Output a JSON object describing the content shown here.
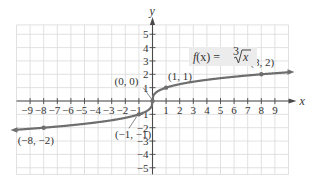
{
  "chart_data": {
    "type": "line",
    "title": "",
    "function_label": "f(x) = ∛x",
    "function_label_parts": {
      "lhs": "f(x) = ",
      "index": "3",
      "radical": "√",
      "radicand": "x"
    },
    "xlabel": "x",
    "ylabel": "y",
    "xlim": [
      -10,
      10
    ],
    "ylim": [
      -5.7,
      5.7
    ],
    "grid": true,
    "x_ticks": [
      -9,
      -8,
      -7,
      -6,
      -5,
      -4,
      -3,
      -2,
      -1,
      1,
      2,
      3,
      4,
      5,
      6,
      7,
      8,
      9
    ],
    "y_ticks": [
      -5,
      -4,
      -3,
      -2,
      -1,
      1,
      2,
      3,
      4,
      5
    ],
    "x_tick_labels": [
      "−9",
      "−8",
      "−7",
      "−6",
      "−5",
      "−4",
      "−3",
      "−2",
      "−1",
      "1",
      "2",
      "3",
      "4",
      "5",
      "6",
      "7",
      "8",
      "9"
    ],
    "y_tick_labels": [
      "−5",
      "−4",
      "−3",
      "−2",
      "−1",
      "1",
      "2",
      "3",
      "4",
      "5"
    ],
    "series": [
      {
        "name": "f(x) = ∛x",
        "x": [
          -10,
          -8,
          -1,
          0,
          1,
          8,
          10
        ],
        "y": [
          -2.154,
          -2,
          -1,
          0,
          1,
          2,
          2.154
        ]
      }
    ],
    "labeled_points": [
      {
        "x": -8,
        "y": -2,
        "label": "(−8, −2)"
      },
      {
        "x": -1,
        "y": -1,
        "label": "(−1, −1)"
      },
      {
        "x": 0,
        "y": 0,
        "label": "(0, 0)"
      },
      {
        "x": 1,
        "y": 1,
        "label": "(1, 1)"
      },
      {
        "x": 8,
        "y": 2,
        "label": "(8, 2)"
      }
    ],
    "colors": {
      "curve": "#6e6e6e",
      "grid": "#d9d9d9",
      "axis": "#4a4a4a",
      "label_bg": "#ececec"
    }
  }
}
